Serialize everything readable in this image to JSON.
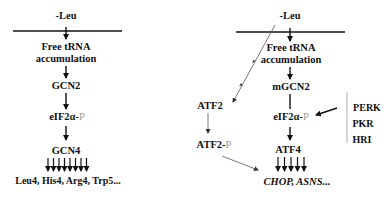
{
  "left_pathway": {
    "stimulus": "-Leu",
    "step1_line1": "Free tRNA",
    "step1_line2": "accumulation",
    "kinase": "GCN2",
    "phospho_prefix": "eIF2α-",
    "phospho_suffix": "P",
    "transcription_factor": "GCN4",
    "targets": "Leu4, His4, Arg4, Trp5..."
  },
  "right_pathway": {
    "stimulus": "-Leu",
    "step1_line1": "Free tRNA",
    "step1_line2": "accumulation",
    "kinase": "mGCN2",
    "phospho_prefix": "eIF2α-",
    "phospho_suffix": "P",
    "transcription_factor": "ATF4",
    "targets": "CHOP, ASNS...",
    "side_factor": "ATF2",
    "side_factor_phospho_prefix": "ATF2-",
    "side_factor_phospho_suffix": "P",
    "other_kinases": [
      "PERK",
      "PKR",
      "HRI"
    ]
  },
  "colors": {
    "text": "#111111",
    "phospho": "#9a9a9a",
    "thin_arrow": "#555555"
  }
}
